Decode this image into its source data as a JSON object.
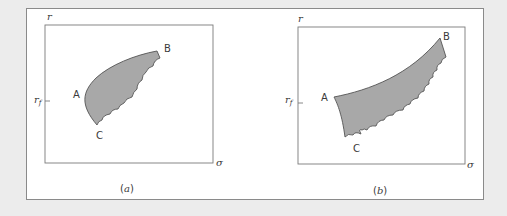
{
  "figure": {
    "colors": {
      "background": "#ececec",
      "frame_bg": "#ffffff",
      "frame_border": "#8a8a8a",
      "axis": "#7a7a7a",
      "region_fill": "#a8a8a8",
      "region_stroke": "#555555",
      "text": "#3a3a3a"
    },
    "panels": [
      {
        "caption": "(a)",
        "y_axis_label": "r",
        "x_axis_label": "σ",
        "tick_label": "r",
        "tick_subscript": "f",
        "points": {
          "A": "A",
          "B": "B",
          "C": "C"
        }
      },
      {
        "caption": "(b)",
        "y_axis_label": "r",
        "x_axis_label": "σ",
        "tick_label": "r",
        "tick_subscript": "f",
        "points": {
          "A": "A",
          "B": "B",
          "C": "C"
        }
      }
    ]
  }
}
